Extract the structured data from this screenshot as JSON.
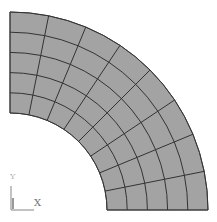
{
  "viewport": {
    "title": ""
  },
  "mesh": {
    "shape": "quarter-annulus",
    "center": [
      10,
      210
    ],
    "inner_radius": 97,
    "outer_radius": 198,
    "start_angle_deg": 0,
    "end_angle_deg": 90,
    "radial_divisions": 5,
    "angular_divisions": 8,
    "fill_color": "#a3a3a3",
    "line_color": "#333333",
    "boundary_color": "#555555"
  },
  "triad": {
    "origin": [
      11,
      210
    ],
    "x_label": "X",
    "y_label": "Y",
    "x_axis_length": 23,
    "y_axis_length": 24,
    "color": "#9a9a9a"
  }
}
